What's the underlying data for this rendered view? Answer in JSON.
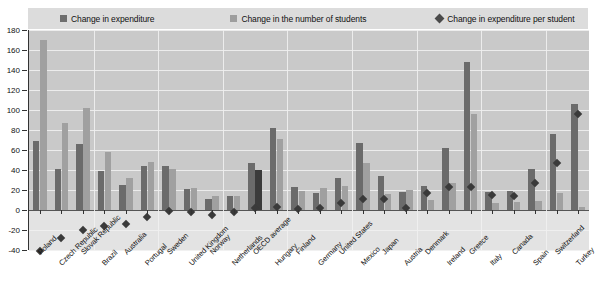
{
  "legend": {
    "items": [
      {
        "label": "Change in expenditure",
        "marker": "square-dark",
        "color": "#6e6e6e"
      },
      {
        "label": "Change in the number of students",
        "marker": "square-light",
        "color": "#9e9e9e"
      },
      {
        "label": "Change in expenditure per student",
        "marker": "diamond",
        "color": "#4a4a4a"
      }
    ]
  },
  "chart_data": {
    "type": "bar",
    "title": "",
    "xlabel": "",
    "ylabel": "",
    "ylim": [
      -40,
      180
    ],
    "yticks": [
      -40,
      -20,
      0,
      20,
      40,
      60,
      80,
      100,
      120,
      140,
      160,
      180
    ],
    "grid": true,
    "legend_position": "top",
    "categories": [
      "Poland",
      "Czech Republic",
      "Slovak Republic",
      "Brazil",
      "Australia",
      "Portugal",
      "Sweden",
      "United Kingdom",
      "Norway",
      "Netherlands",
      "OECD average",
      "Hungary",
      "Finland",
      "Germany",
      "United States",
      "Mexico",
      "Japan",
      "Austria",
      "Denmark",
      "Ireland",
      "Greece",
      "Italy",
      "Canada",
      "Spain",
      "Switzerland",
      "Turkey"
    ],
    "series": [
      {
        "name": "Change in expenditure",
        "color": "#6b6b6b",
        "values": [
          69,
          41,
          66,
          39,
          25,
          44,
          44,
          21,
          11,
          14,
          47,
          82,
          23,
          17,
          32,
          67,
          34,
          18,
          24,
          62,
          148,
          18,
          19,
          41,
          76,
          106
        ]
      },
      {
        "name": "Change in the number of students",
        "color": "#a0a0a0",
        "values": [
          170,
          87,
          102,
          58,
          32,
          48,
          41,
          22,
          14,
          14,
          40,
          71,
          19,
          22,
          24,
          47,
          16,
          20,
          10,
          27,
          96,
          7,
          8,
          9,
          17,
          3
        ]
      },
      {
        "name": "Change in expenditure per student",
        "color": "#3a3a3a",
        "type": "marker",
        "values": [
          -38,
          -25,
          -17,
          -13,
          -11,
          -4,
          2,
          1,
          -2,
          1,
          5,
          6,
          4,
          5,
          10,
          14,
          14,
          5,
          20,
          26,
          26,
          18,
          17,
          30,
          50,
          99
        ]
      }
    ]
  }
}
